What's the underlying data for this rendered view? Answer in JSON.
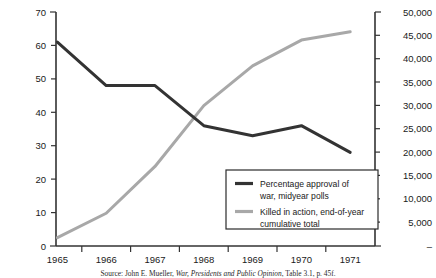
{
  "chart_data": {
    "type": "line",
    "title": "",
    "xlabel": "",
    "categories": [
      "1965",
      "1966",
      "1967",
      "1968",
      "1969",
      "1970",
      "1971"
    ],
    "grid": false,
    "legend_position": "inside-bottom-right",
    "axes": {
      "left": {
        "label": "",
        "ylim": [
          0,
          70
        ],
        "ticks": [
          0,
          10,
          20,
          30,
          40,
          50,
          60,
          70
        ],
        "tick_labels": [
          "0",
          "10",
          "20",
          "30",
          "40",
          "50",
          "60",
          "70"
        ]
      },
      "right": {
        "label": "",
        "ylim": [
          0,
          50000
        ],
        "ticks": [
          0,
          5000,
          10000,
          15000,
          20000,
          25000,
          30000,
          35000,
          40000,
          45000,
          50000
        ],
        "tick_labels": [
          "–",
          "5,000",
          "10,000",
          "15,000",
          "20,000",
          "25,000",
          "30,000",
          "35,000",
          "40,000",
          "45,000",
          "50,000"
        ]
      }
    },
    "series": [
      {
        "name": "Percentage approval of war, midyear polls",
        "legend_label_line1": "Percentage approval of",
        "legend_label_line2": "war, midyear polls",
        "axis": "left",
        "color": "#333333",
        "values": [
          61,
          48,
          48,
          36,
          33,
          36,
          28
        ]
      },
      {
        "name": "Killed in action, end-of-year cumulative total",
        "legend_label_line1": "Killed in action, end-of-year",
        "legend_label_line2": "cumulative total",
        "axis": "right",
        "color": "#a8a8a8",
        "values": [
          1800,
          7000,
          17000,
          30000,
          38500,
          44000,
          45800
        ]
      }
    ]
  },
  "source": {
    "prefix": "Source: John E. Mueller, ",
    "italic_title": "War, Presidents and Public Opinion",
    "suffix": ", Table 3.1, p. 45f."
  }
}
